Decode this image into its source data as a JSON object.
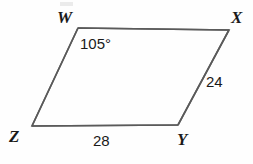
{
  "figure": {
    "type": "parallelogram-diagram",
    "background_color": "#fefefe",
    "stroke_color": "#5a5a5a",
    "text_color": "#1a1a1a",
    "stroke_width": 1.6,
    "vertices": [
      {
        "name": "W",
        "label": "W",
        "x": 78,
        "y": 28
      },
      {
        "name": "X",
        "label": "X",
        "x": 229,
        "y": 30
      },
      {
        "name": "Y",
        "label": "Y",
        "x": 178,
        "y": 125
      },
      {
        "name": "Z",
        "label": "Z",
        "x": 32,
        "y": 126
      }
    ],
    "vertex_labels": {
      "W": "W",
      "X": "X",
      "Y": "Y",
      "Z": "Z"
    },
    "measurements": {
      "angle_at_W": "105°",
      "side_XY": "24",
      "side_ZY": "28"
    },
    "edges": [
      {
        "from": "W",
        "to": "X"
      },
      {
        "from": "X",
        "to": "Y"
      },
      {
        "from": "Y",
        "to": "Z"
      },
      {
        "from": "Z",
        "to": "W"
      }
    ]
  }
}
